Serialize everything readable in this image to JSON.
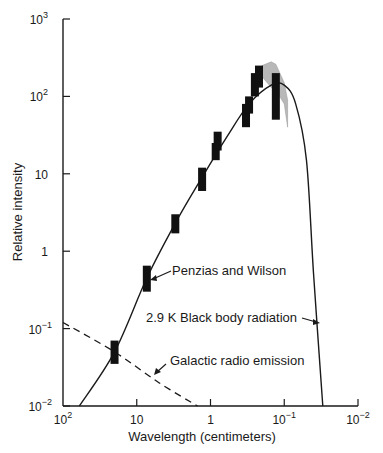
{
  "chart_data": {
    "type": "line",
    "title": "",
    "xlabel": "Wavelength (centimeters)",
    "ylabel": "Relative intensity",
    "x_scale": "log",
    "y_scale": "log",
    "xlim": [
      100,
      0.01
    ],
    "ylim": [
      0.01,
      1000
    ],
    "x_ticks": [
      {
        "value": 100,
        "base": "10",
        "exp": "2"
      },
      {
        "value": 10,
        "base": "10",
        "exp": ""
      },
      {
        "value": 1,
        "base": "1",
        "exp": ""
      },
      {
        "value": 0.1,
        "base": "10",
        "exp": "−1"
      },
      {
        "value": 0.01,
        "base": "10",
        "exp": "−2"
      }
    ],
    "y_ticks": [
      {
        "value": 1000,
        "base": "10",
        "exp": "3"
      },
      {
        "value": 100,
        "base": "10",
        "exp": "2"
      },
      {
        "value": 10,
        "base": "10",
        "exp": ""
      },
      {
        "value": 1,
        "base": "1",
        "exp": ""
      },
      {
        "value": 0.1,
        "base": "10",
        "exp": "−1"
      },
      {
        "value": 0.01,
        "base": "10",
        "exp": "−2"
      }
    ],
    "grid": false,
    "series": [
      {
        "name": "2.9 K Black body radiation",
        "style": "solid",
        "x": [
          60,
          20,
          7.3,
          3.0,
          1.3,
          0.6,
          0.3,
          0.15,
          0.1,
          0.07,
          0.05,
          0.04,
          0.03
        ],
        "y": [
          0.01,
          0.05,
          0.45,
          2.3,
          9,
          30,
          80,
          140,
          140,
          80,
          15,
          0.5,
          0.01
        ]
      },
      {
        "name": "Galactic radio emission",
        "style": "dashed",
        "x": [
          100,
          20,
          5,
          1.5
        ],
        "y": [
          0.12,
          0.05,
          0.02,
          0.01
        ]
      },
      {
        "name": "Measurements",
        "style": "error-bars",
        "points": [
          {
            "x": 20,
            "y_low": 0.035,
            "y_high": 0.07
          },
          {
            "x": 7.3,
            "y_low": 0.3,
            "y_high": 0.65
          },
          {
            "x": 3.0,
            "y_low": 1.7,
            "y_high": 3.0
          },
          {
            "x": 1.3,
            "y_low": 6,
            "y_high": 12
          },
          {
            "x": 0.85,
            "y_low": 15,
            "y_high": 25
          },
          {
            "x": 0.8,
            "y_low": 20,
            "y_high": 35
          },
          {
            "x": 0.33,
            "y_low": 40,
            "y_high": 80
          },
          {
            "x": 0.3,
            "y_low": 60,
            "y_high": 100
          },
          {
            "x": 0.25,
            "y_low": 100,
            "y_high": 200
          },
          {
            "x": 0.22,
            "y_low": 130,
            "y_high": 250
          },
          {
            "x": 0.13,
            "y_low": 50,
            "y_high": 200
          }
        ]
      },
      {
        "name": "Shaded measurement region",
        "style": "gray-band",
        "x": [
          0.2,
          0.15,
          0.13,
          0.1,
          0.09
        ],
        "y_low": [
          180,
          130,
          120,
          80,
          40
        ],
        "y_high": [
          250,
          280,
          260,
          150,
          90
        ]
      }
    ],
    "annotations": [
      {
        "text": "Penzias and Wilson",
        "x": 7.3,
        "y": 0.45
      },
      {
        "text": "2.9 K Black body radiation",
        "x": 0.055,
        "y": 0.1
      },
      {
        "text": "Galactic radio emission",
        "x": 1.8,
        "y": 0.035
      }
    ],
    "legend": null
  }
}
